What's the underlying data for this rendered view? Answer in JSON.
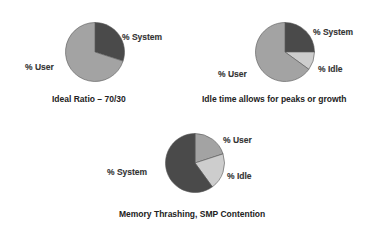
{
  "chart_data": [
    {
      "type": "pie",
      "title": "Ideal Ratio – 70/30",
      "slices": [
        {
          "label": "% System",
          "value": 30,
          "color": "#4a4a4a"
        },
        {
          "label": "% User",
          "value": 70,
          "color": "#a3a3a3"
        }
      ]
    },
    {
      "type": "pie",
      "title": "Idle time allows for peaks or growth",
      "slices": [
        {
          "label": "% System",
          "value": 25,
          "color": "#4a4a4a"
        },
        {
          "label": "% Idle",
          "value": 10,
          "color": "#cdcdcd"
        },
        {
          "label": "% User",
          "value": 65,
          "color": "#a3a3a3"
        }
      ]
    },
    {
      "type": "pie",
      "title": "Memory Thrashing, SMP Contention",
      "slices": [
        {
          "label": "% User",
          "value": 20,
          "color": "#a3a3a3"
        },
        {
          "label": "% Idle",
          "value": 20,
          "color": "#cdcdcd"
        },
        {
          "label": "% System",
          "value": 60,
          "color": "#4a4a4a"
        }
      ]
    }
  ],
  "labels": {
    "p1_system": "% System",
    "p1_user": "% User",
    "p1_title": "Ideal Ratio – 70/30",
    "p2_system": "% System",
    "p2_idle": "% Idle",
    "p2_user": "% User",
    "p2_title": "Idle time allows for peaks or growth",
    "p3_user": "% User",
    "p3_idle": "% Idle",
    "p3_system": "% System",
    "p3_title": "Memory Thrashing, SMP Contention"
  }
}
